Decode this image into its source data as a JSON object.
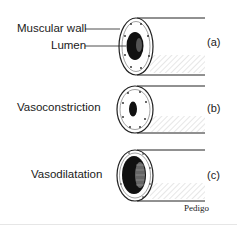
{
  "figure": {
    "panels": [
      {
        "id": "a",
        "tag": "(a)",
        "labels": [
          "Muscular wall",
          "Lumen"
        ],
        "state": "normal"
      },
      {
        "id": "b",
        "tag": "(b)",
        "labels": [
          "Vasoconstriction"
        ],
        "state": "constricted"
      },
      {
        "id": "c",
        "tag": "(c)",
        "labels": [
          "Vasodilatation"
        ],
        "state": "dilated"
      }
    ],
    "credit": "Pedigo"
  }
}
